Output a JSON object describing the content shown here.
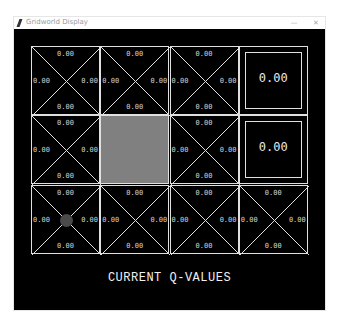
{
  "window": {
    "title": "Gridworld Display",
    "minimize_label": "—",
    "close_label": "✕"
  },
  "grid": {
    "rows": 3,
    "cols": 4,
    "cells": [
      {
        "row": 0,
        "col": 0,
        "type": "qcell",
        "north": "0.00",
        "south": "0.00",
        "west": "0.00",
        "east": "0.00"
      },
      {
        "row": 0,
        "col": 1,
        "type": "qcell",
        "north": "0.00",
        "south": "0.00",
        "west": "0.00",
        "east": "0.00"
      },
      {
        "row": 0,
        "col": 2,
        "type": "qcell",
        "north": "0.00",
        "south": "0.00",
        "west": "0.00",
        "east": "0.00"
      },
      {
        "row": 0,
        "col": 3,
        "type": "terminal",
        "value": "0.00"
      },
      {
        "row": 1,
        "col": 0,
        "type": "qcell",
        "north": "0.00",
        "south": "0.00",
        "west": "0.00",
        "east": "0.00"
      },
      {
        "row": 1,
        "col": 1,
        "type": "wall"
      },
      {
        "row": 1,
        "col": 2,
        "type": "qcell",
        "north": "0.00",
        "south": "0.00",
        "west": "0.00",
        "east": "0.00"
      },
      {
        "row": 1,
        "col": 3,
        "type": "terminal",
        "value": "0.00"
      },
      {
        "row": 2,
        "col": 0,
        "type": "qcell",
        "north": "0.00",
        "south": "0.00",
        "west": "0.00",
        "east": "0.00",
        "agent": true
      },
      {
        "row": 2,
        "col": 1,
        "type": "qcell",
        "north": "0.00",
        "south": "0.00",
        "west": "0.00",
        "east": "0.00"
      },
      {
        "row": 2,
        "col": 2,
        "type": "qcell",
        "north": "0.00",
        "south": "0.00",
        "west": "0.00",
        "east": "0.00"
      },
      {
        "row": 2,
        "col": 3,
        "type": "qcell",
        "north": "0.00",
        "south": "0.00",
        "west": "0.00",
        "east": "0.00"
      }
    ]
  },
  "colors": {
    "background": "#000000",
    "lines": "#e0e0e0",
    "wall": "#808080",
    "agent": "#4a4a4a"
  },
  "caption": "CURRENT Q-VALUES"
}
